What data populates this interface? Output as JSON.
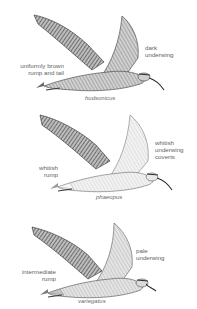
{
  "figure": {
    "panels": [
      {
        "caption": "hudsonicus",
        "labels": [
          {
            "text": "dark\nunderwing",
            "line1": "dark",
            "line2": "underwing"
          },
          {
            "text": "uniformly brown\nrump and tail",
            "line1": "uniformly brown",
            "line2": "rump and tail"
          }
        ],
        "underwing_color": "#8a8a8a",
        "rump_color": "#7a7a7a"
      },
      {
        "caption": "phaeopus",
        "labels": [
          {
            "text": "whitish\nunderwing\ncoverts",
            "line1": "whitish",
            "line2": "underwing",
            "line3": "coverts"
          },
          {
            "text": "whitish\nrump",
            "line1": "whitish",
            "line2": "rump"
          }
        ],
        "underwing_color": "#e6e6e6",
        "rump_color": "#f2f2f2"
      },
      {
        "caption": "variegatus",
        "labels": [
          {
            "text": "pale\nunderwing",
            "line1": "pale",
            "line2": "underwing"
          },
          {
            "text": "intermediate\nrump",
            "line1": "intermediate",
            "line2": "rump"
          }
        ],
        "underwing_color": "#bdbdbd",
        "rump_color": "#c4c4c4"
      }
    ]
  }
}
